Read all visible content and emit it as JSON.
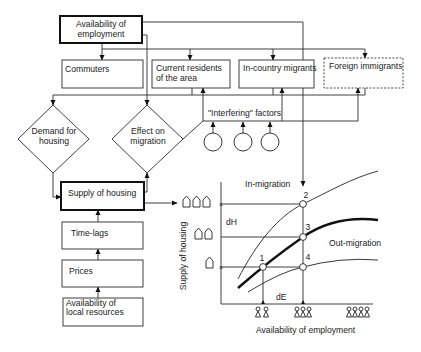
{
  "diagram": {
    "boxes": {
      "availability_employment": [
        "Availability of",
        "employment"
      ],
      "commuters": "Commuters",
      "current_residents": [
        "Current residents",
        "of the area"
      ],
      "in_country_migrants": "In-country migrants",
      "foreign_immigrants": "Foreign immigrants",
      "interfering_factors": "\"Interfering\" factors",
      "demand_for_housing": [
        "Demand for",
        "housing"
      ],
      "effect_on_migration": [
        "Effect on",
        "migration"
      ],
      "supply_of_housing": "Supply of housing",
      "time_lags": "Time-lags",
      "prices": "Prices",
      "local_resources": [
        "Availability of",
        "local resources"
      ]
    },
    "graph": {
      "in_migration_label": "In-migration",
      "out_migration_label": "Out-migration",
      "y_axis_label": "Supply of housing",
      "x_axis_label": "Availability of employment",
      "dH_label": "dH",
      "dE_label": "dE",
      "points": [
        "1",
        "2",
        "3",
        "4"
      ],
      "house_icon_levels": [
        3,
        2,
        1
      ],
      "people_icon_groups": [
        2,
        3,
        4
      ],
      "curves": [
        "In-migration (upper thin)",
        "Housing supply (thick)",
        "Out-migration (lower thin)"
      ]
    }
  }
}
